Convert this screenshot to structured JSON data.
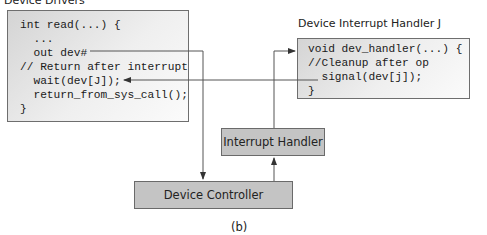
{
  "diagram": {
    "device_drivers": {
      "title": "Device Drivers",
      "code_lines": [
        "int read(...) {",
        "  ...",
        "  out dev#",
        "// Return after interrupt",
        "  wait(dev[J]);",
        "  return_from_sys_call();",
        "}"
      ]
    },
    "interrupt_handler_j": {
      "title": "Device Interrupt Handler J",
      "code_lines": [
        "void dev_handler(...) {",
        "//Cleanup after op",
        "  signal(dev[j]);",
        "}"
      ]
    },
    "interrupt_handler": {
      "label": "Interrupt Handler"
    },
    "device_controller": {
      "label": "Device Controller"
    },
    "caption": "(b)",
    "colors": {
      "block_fill": "#c4c4c4",
      "line": "#555555"
    }
  }
}
